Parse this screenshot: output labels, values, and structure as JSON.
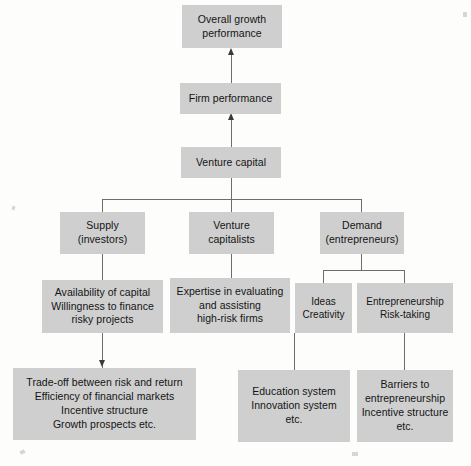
{
  "diagram": {
    "colors": {
      "node_fill": "#cfcfcf",
      "connector": "#6d6d6d",
      "arrow": "#3a3a3a",
      "background": "#fdfdfc",
      "text": "#141414"
    },
    "nodes": [
      {
        "id": "overall-growth-performance",
        "label": "Overall growth\nperformance"
      },
      {
        "id": "firm-performance",
        "label": "Firm performance"
      },
      {
        "id": "venture-capital",
        "label": "Venture capital"
      },
      {
        "id": "supply-investors",
        "label": "Supply\n(investors)"
      },
      {
        "id": "venture-capitalists",
        "label": "Venture\ncapitalists"
      },
      {
        "id": "demand-entrepreneurs",
        "label": "Demand\n(entrepreneurs)"
      },
      {
        "id": "availability-of-capital",
        "label": "Availability of capital\nWillingness to finance\nrisky projects"
      },
      {
        "id": "expertise-in-evaluating",
        "label": "Expertise in evaluating\nand assisting\nhigh-risk firms"
      },
      {
        "id": "ideas-creativity",
        "label": "Ideas\nCreativity"
      },
      {
        "id": "entrepreneurship-risk-taking",
        "label": "Entrepreneurship\nRisk-taking"
      },
      {
        "id": "trade-off-risk-return",
        "label": "Trade-off between risk and return\nEfficiency of financial markets\nIncentive structure\nGrowth prospects etc."
      },
      {
        "id": "education-innovation-system",
        "label": "Education system\nInnovation system\netc."
      },
      {
        "id": "barriers-to-entrepreneurship",
        "label": "Barriers to\nentrepreneurship\nIncentive structure\netc."
      }
    ],
    "edges": [
      {
        "from": "firm-performance",
        "to": "overall-growth-performance",
        "arrow": true
      },
      {
        "from": "venture-capital",
        "to": "firm-performance",
        "arrow": true
      },
      {
        "from": "venture-capital",
        "to": "supply-investors",
        "arrow": false
      },
      {
        "from": "venture-capital",
        "to": "venture-capitalists",
        "arrow": false
      },
      {
        "from": "venture-capital",
        "to": "demand-entrepreneurs",
        "arrow": false
      },
      {
        "from": "supply-investors",
        "to": "availability-of-capital",
        "arrow": false
      },
      {
        "from": "venture-capitalists",
        "to": "expertise-in-evaluating",
        "arrow": false
      },
      {
        "from": "demand-entrepreneurs",
        "to": "ideas-creativity",
        "arrow": false
      },
      {
        "from": "demand-entrepreneurs",
        "to": "entrepreneurship-risk-taking",
        "arrow": false
      },
      {
        "from": "availability-of-capital",
        "to": "trade-off-risk-return",
        "arrow": true
      },
      {
        "from": "ideas-creativity",
        "to": "education-innovation-system",
        "arrow": false
      },
      {
        "from": "entrepreneurship-risk-taking",
        "to": "barriers-to-entrepreneurship",
        "arrow": false
      }
    ]
  }
}
